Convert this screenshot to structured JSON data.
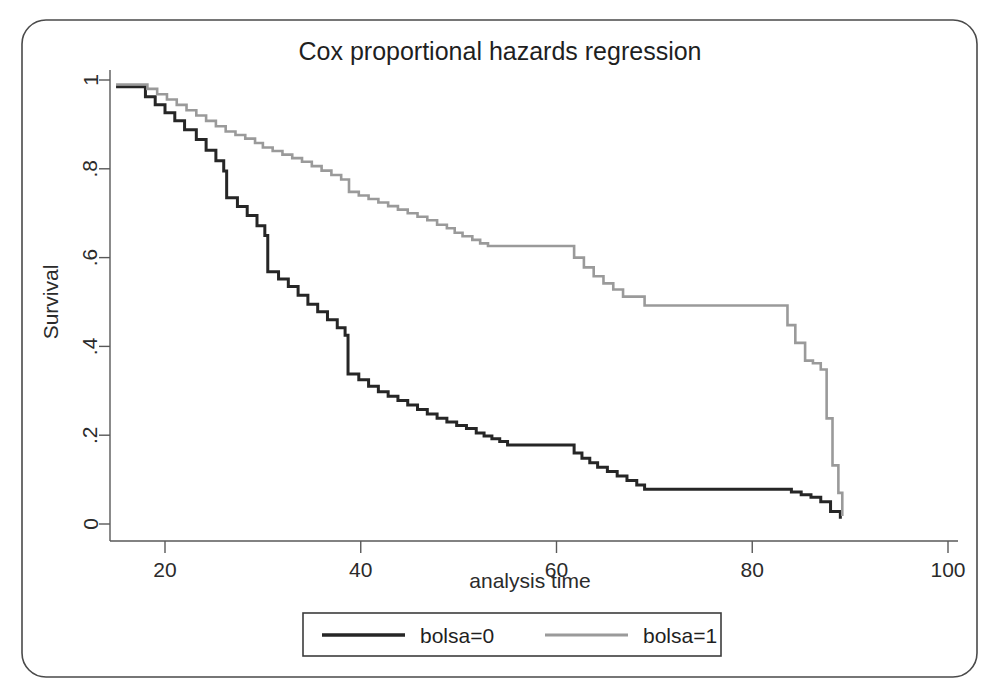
{
  "figure": {
    "width": 1000,
    "height": 698,
    "background": "#ffffff",
    "frame_color": "#4a4a4a",
    "axis_color": "#595959"
  },
  "chart_data": {
    "type": "line",
    "subtype": "step-survival-curve",
    "title": "Cox proportional hazards regression",
    "xlabel": "analysis time",
    "ylabel": "Survival",
    "xlim": [
      14,
      102
    ],
    "ylim": [
      0,
      1
    ],
    "xticks": [
      20,
      40,
      60,
      80,
      100
    ],
    "xtick_labels": [
      "20",
      "40",
      "60",
      "80",
      "100"
    ],
    "yticks": [
      0,
      0.2,
      0.4,
      0.6,
      0.8,
      1
    ],
    "ytick_labels": [
      "0",
      ".2",
      ".4",
      ".6",
      ".8",
      "1"
    ],
    "grid": false,
    "legend_position": "bottom-center",
    "series": [
      {
        "name": "bolsa=0",
        "color": "#262626",
        "width": 3.0,
        "x": [
          15.0,
          17.2,
          18.0,
          19.0,
          20.0,
          21.0,
          22.0,
          23.2,
          24.2,
          25.2,
          26.0,
          26.3,
          27.4,
          28.4,
          29.4,
          30.2,
          30.5,
          31.6,
          32.6,
          33.6,
          34.6,
          35.6,
          36.6,
          37.6,
          38.4,
          38.7,
          39.8,
          40.8,
          41.8,
          42.8,
          43.8,
          44.8,
          45.8,
          46.8,
          47.8,
          48.8,
          49.8,
          50.8,
          51.8,
          52.6,
          53.4,
          54.2,
          55.0,
          61.0,
          61.8,
          62.6,
          63.4,
          64.2,
          65.2,
          66.2,
          67.2,
          68.2,
          69.0,
          83.0,
          84.0,
          85.0,
          86.0,
          87.0,
          88.0,
          89.0
        ],
        "y": [
          0.985,
          0.985,
          0.962,
          0.944,
          0.926,
          0.908,
          0.888,
          0.866,
          0.842,
          0.818,
          0.795,
          0.735,
          0.715,
          0.695,
          0.672,
          0.65,
          0.568,
          0.552,
          0.535,
          0.515,
          0.495,
          0.478,
          0.46,
          0.442,
          0.425,
          0.338,
          0.325,
          0.31,
          0.298,
          0.288,
          0.278,
          0.268,
          0.258,
          0.248,
          0.238,
          0.23,
          0.222,
          0.215,
          0.205,
          0.198,
          0.192,
          0.186,
          0.178,
          0.178,
          0.16,
          0.148,
          0.138,
          0.128,
          0.118,
          0.108,
          0.098,
          0.088,
          0.078,
          0.078,
          0.072,
          0.066,
          0.06,
          0.05,
          0.028,
          0.012
        ]
      },
      {
        "name": "bolsa=1",
        "color": "#9a9a9a",
        "width": 2.6,
        "x": [
          15.0,
          17.2,
          18.2,
          19.2,
          20.2,
          21.2,
          22.2,
          23.2,
          24.2,
          25.2,
          26.2,
          27.2,
          28.2,
          29.2,
          30.0,
          31.0,
          32.0,
          33.0,
          34.0,
          35.0,
          36.0,
          37.0,
          38.0,
          38.8,
          39.8,
          40.8,
          41.8,
          42.8,
          43.8,
          44.8,
          45.8,
          46.8,
          47.8,
          48.8,
          49.6,
          50.4,
          51.4,
          52.2,
          53.0,
          54.0,
          55.0,
          61.0,
          61.8,
          62.8,
          63.8,
          64.8,
          65.8,
          66.8,
          69.0,
          83.0,
          83.6,
          84.4,
          85.4,
          86.2,
          87.0,
          87.6,
          88.2,
          88.8,
          89.2
        ],
        "y": [
          0.99,
          0.99,
          0.98,
          0.968,
          0.956,
          0.944,
          0.932,
          0.92,
          0.908,
          0.896,
          0.884,
          0.876,
          0.868,
          0.858,
          0.848,
          0.84,
          0.832,
          0.824,
          0.816,
          0.806,
          0.796,
          0.786,
          0.776,
          0.748,
          0.74,
          0.732,
          0.724,
          0.716,
          0.708,
          0.7,
          0.692,
          0.684,
          0.674,
          0.666,
          0.656,
          0.648,
          0.64,
          0.632,
          0.626,
          0.626,
          0.626,
          0.626,
          0.6,
          0.578,
          0.558,
          0.542,
          0.528,
          0.512,
          0.492,
          0.492,
          0.448,
          0.408,
          0.368,
          0.362,
          0.348,
          0.238,
          0.132,
          0.07,
          0.018
        ]
      }
    ]
  },
  "legend": {
    "entries": [
      {
        "label": "bolsa=0",
        "color": "#262626",
        "width": 3.4
      },
      {
        "label": "bolsa=1",
        "color": "#9a9a9a",
        "width": 3.0
      }
    ]
  }
}
